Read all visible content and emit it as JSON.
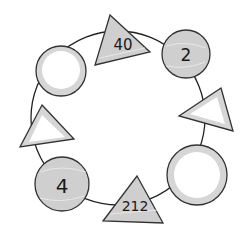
{
  "diagram": {
    "type": "number-cycle",
    "ring": {
      "cx": 123,
      "cy": 118,
      "r": 86,
      "stroke": "#222222"
    },
    "colors": {
      "shaded_fill": "#cfcfcf",
      "blank_fill": "#ffffff",
      "rim_fill": "#d6d6d6",
      "stroke": "#333333"
    },
    "nodes": [
      {
        "id": "triangle-top",
        "shape": "triangle",
        "label": "40",
        "shaded": true
      },
      {
        "id": "circle-top-right",
        "shape": "circle",
        "label": "2",
        "shaded": true
      },
      {
        "id": "triangle-right",
        "shape": "triangle",
        "label": "",
        "shaded": false
      },
      {
        "id": "circle-bottom-right",
        "shape": "circle",
        "label": "",
        "shaded": false
      },
      {
        "id": "triangle-bottom",
        "shape": "triangle",
        "label": "212",
        "shaded": true
      },
      {
        "id": "circle-bottom-left",
        "shape": "circle",
        "label": "4",
        "shaded": true
      },
      {
        "id": "triangle-left",
        "shape": "triangle",
        "label": "",
        "shaded": false
      },
      {
        "id": "circle-top-left",
        "shape": "circle",
        "label": "",
        "shaded": false
      }
    ]
  }
}
